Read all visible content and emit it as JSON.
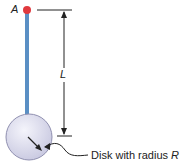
{
  "diagram": {
    "point_label": "A",
    "length_label": "L",
    "caption_prefix": "Disk with radius ",
    "caption_var": "R",
    "colors": {
      "rod": "#5a8fc4",
      "pivot": "#e0393e",
      "disk_fill": "#dcdcef",
      "disk_stroke": "#8a8aa8",
      "line": "#222222"
    }
  }
}
